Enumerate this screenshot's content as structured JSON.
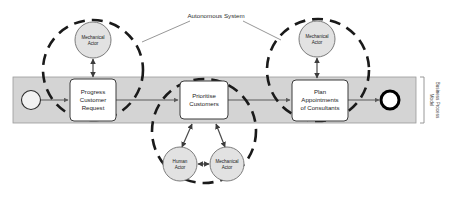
{
  "diagram": {
    "annotation": {
      "label": "Autonomous System",
      "x": 216,
      "y": 16
    },
    "pool": {
      "label_line1": "Business Process",
      "label_line2": "Model",
      "x": 13,
      "y": 77,
      "width": 403,
      "height": 46,
      "fill": "#d4d4d4",
      "stroke": "#9a9a9a"
    },
    "events": [
      {
        "id": "start-event",
        "name": "start-event",
        "type": "start",
        "cx": 31,
        "cy": 100,
        "r": 9.5,
        "stroke_width": 1.1,
        "fill": "#f2f2f2"
      },
      {
        "id": "end-event",
        "name": "end-event",
        "type": "end",
        "cx": 390,
        "cy": 100,
        "r": 9,
        "stroke_width": 3,
        "fill": "#ffffff"
      }
    ],
    "tasks": [
      {
        "id": "task-progress-customer-request",
        "lines": [
          "Progress",
          "Customer",
          "Request"
        ],
        "x": 70,
        "y": 79,
        "width": 46,
        "height": 42
      },
      {
        "id": "task-prioritise-customers",
        "lines": [
          "Prioritise",
          "Customers"
        ],
        "x": 180,
        "y": 81,
        "width": 48,
        "height": 38
      },
      {
        "id": "task-plan-appointments",
        "lines": [
          "Plan",
          "Appointments",
          "of Consultants"
        ],
        "x": 292,
        "y": 80,
        "width": 56,
        "height": 41
      }
    ],
    "actors": [
      {
        "id": "actor-mechanical-left",
        "lines": [
          "Mechanical",
          "Actor"
        ],
        "cx": 93,
        "cy": 40,
        "r": 18
      },
      {
        "id": "actor-human-middle",
        "lines": [
          "Human",
          "Actor"
        ],
        "cx": 180,
        "cy": 164,
        "r": 17
      },
      {
        "id": "actor-mechanical-middle",
        "lines": [
          "Mechanical",
          "Actor"
        ],
        "cx": 227,
        "cy": 164,
        "r": 17
      },
      {
        "id": "actor-mechanical-right",
        "lines": [
          "Mechanical",
          "Actor"
        ],
        "cx": 317,
        "cy": 39,
        "r": 18
      }
    ],
    "boundaries": [
      {
        "id": "boundary-left",
        "cx": 93,
        "cy": 70,
        "r": 50
      },
      {
        "id": "boundary-middle",
        "cx": 204,
        "cy": 131,
        "r": 52
      },
      {
        "id": "boundary-right",
        "cx": 318,
        "cy": 70,
        "r": 51
      }
    ],
    "sequence_flows": [
      {
        "id": "flow-start-to-task1",
        "from": "start-event",
        "to": "task-progress-customer-request"
      },
      {
        "id": "flow-task1-to-task2",
        "from": "task-progress-customer-request",
        "to": "task-prioritise-customers"
      },
      {
        "id": "flow-task2-to-task3",
        "from": "task-prioritise-customers",
        "to": "task-plan-appointments"
      },
      {
        "id": "flow-task3-to-end",
        "from": "task-plan-appointments",
        "to": "end-event"
      }
    ],
    "associations": [
      {
        "id": "assoc-mechanical-left-task1",
        "bidirectional": true
      },
      {
        "id": "assoc-human-middle-task2",
        "bidirectional": true
      },
      {
        "id": "assoc-mechanical-middle-task2",
        "bidirectional": true
      },
      {
        "id": "assoc-human-to-mechanical-middle",
        "bidirectional": true
      },
      {
        "id": "assoc-mechanical-right-task3",
        "bidirectional": true
      }
    ],
    "leader_lines": [
      {
        "id": "leader-left",
        "x1": 190,
        "y1": 21,
        "x2": 142,
        "y2": 42
      },
      {
        "id": "leader-right",
        "x1": 243,
        "y1": 21,
        "x2": 281,
        "y2": 40
      }
    ]
  }
}
